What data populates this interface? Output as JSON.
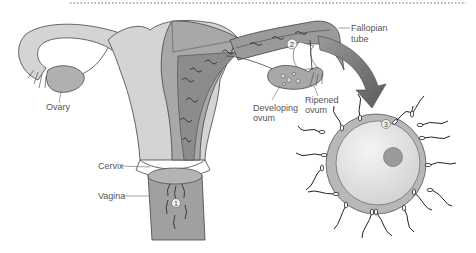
{
  "diagram": {
    "type": "anatomical-illustration",
    "labels": {
      "ovary": "Ovary",
      "fallopian_tube_line1": "Fallopian",
      "fallopian_tube_line2": "tube",
      "developing_ovum_line1": "Developing",
      "developing_ovum_line2": "ovum",
      "ripened_ovum_line1": "Ripened",
      "ripened_ovum_line2": "ovum",
      "cervix": "Cervix",
      "vagina": "Vagina"
    },
    "step_markers": [
      "1",
      "2",
      "3"
    ],
    "colors": {
      "tissue_light": "#d4d4d4",
      "tissue_mid": "#a8a8a8",
      "tissue_dark": "#8c8c8c",
      "ovum_halo": "#b8b8b8",
      "ovum_body": "#e6e6e6",
      "nucleus": "#9a9a9a",
      "outline": "#444444",
      "arrow": "#7a7a7a"
    }
  }
}
